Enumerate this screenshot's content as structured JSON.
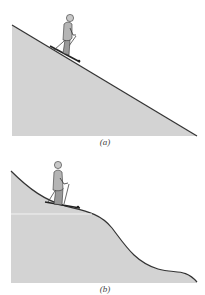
{
  "figure": {
    "panels": [
      {
        "id": "a",
        "label": "(a)",
        "description": "Skier on a constant straight incline"
      },
      {
        "id": "b",
        "label": "(b)",
        "description": "Skier on a curved hill whose slope varies"
      }
    ],
    "colors": {
      "slope_fill": "#d3d3d3",
      "slope_line": "#333333",
      "background": "#ffffff"
    }
  }
}
